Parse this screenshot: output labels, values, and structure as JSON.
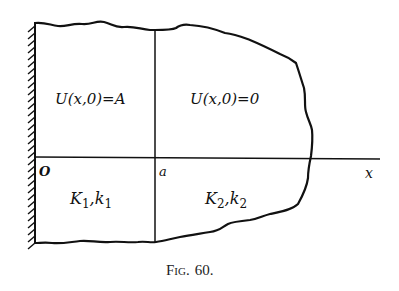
{
  "figure": {
    "caption_prefix": "Fig.",
    "caption_number": "60.",
    "caption": "Fig. 60."
  },
  "labels": {
    "region1_condition": "U(x,0)=A",
    "region2_condition": "U(x,0)=0",
    "origin": "O",
    "interface": "a",
    "axis": "x",
    "region1_props": {
      "K": "K",
      "K_sub": "1",
      "sep": ",",
      "k": "k",
      "k_sub": "1"
    },
    "region2_props": {
      "K": "K",
      "K_sub": "2",
      "sep": ",",
      "k": "k",
      "k_sub": "2"
    }
  },
  "colors": {
    "ink": "#111111",
    "background": "#ffffff"
  }
}
